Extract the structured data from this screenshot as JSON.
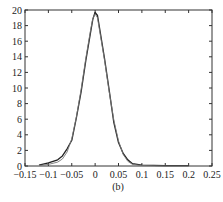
{
  "chart_data": {
    "type": "line",
    "title": "",
    "caption": "(b)",
    "xlabel": "",
    "ylabel": "",
    "xlim": [
      -0.15,
      0.25
    ],
    "ylim": [
      0,
      20
    ],
    "grid": false,
    "legend": null,
    "x_ticks": [
      "-0.15",
      "-0.1",
      "-0.05",
      "0",
      "0.05",
      "0.1",
      "0.15",
      "0.2",
      "0.25"
    ],
    "y_ticks": [
      "0",
      "2",
      "4",
      "6",
      "8",
      "10",
      "12",
      "14",
      "16",
      "18",
      "20"
    ],
    "series": [
      {
        "name": "empirical",
        "x": [
          -0.12,
          -0.1,
          -0.08,
          -0.07,
          -0.06,
          -0.05,
          -0.04,
          -0.03,
          -0.02,
          -0.01,
          -0.005,
          0,
          0.005,
          0.01,
          0.02,
          0.03,
          0.04,
          0.05,
          0.06,
          0.07,
          0.08,
          0.1,
          0.15,
          0.2
        ],
        "y": [
          0.1,
          0.4,
          0.8,
          1.3,
          2.2,
          3.3,
          6.2,
          9.5,
          13.5,
          17.0,
          18.8,
          19.7,
          19.3,
          17.5,
          13.8,
          9.8,
          5.6,
          3.0,
          1.6,
          0.8,
          0.3,
          0.1,
          0.05,
          0.05
        ]
      },
      {
        "name": "fitted",
        "x": [
          -0.12,
          -0.1,
          -0.08,
          -0.07,
          -0.06,
          -0.05,
          -0.04,
          -0.03,
          -0.02,
          -0.01,
          -0.005,
          0,
          0.005,
          0.01,
          0.02,
          0.03,
          0.04,
          0.05,
          0.06,
          0.07,
          0.08,
          0.1,
          0.15,
          0.2
        ],
        "y": [
          0.05,
          0.2,
          0.5,
          0.9,
          1.8,
          3.5,
          6.3,
          9.8,
          13.8,
          17.3,
          18.9,
          19.5,
          19.0,
          17.2,
          13.6,
          9.6,
          5.9,
          3.2,
          1.5,
          0.6,
          0.2,
          0.05,
          0.0,
          0.0
        ]
      }
    ]
  }
}
